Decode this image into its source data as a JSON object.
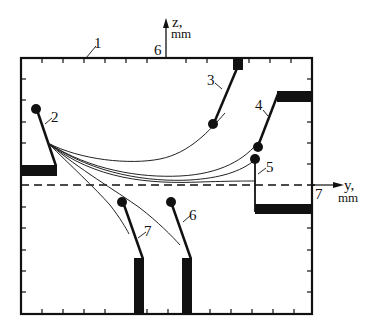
{
  "figure": {
    "type": "schematic",
    "axes": {
      "z_label": "z,",
      "z_unit": "mm",
      "y_label": "y,",
      "y_unit": "mm",
      "z_axis_marker": "6",
      "y_axis_marker": "7"
    },
    "labels": {
      "frame": "1",
      "source": "2",
      "electrode_top": "3",
      "electrode_upper_right": "4",
      "electrode_right": "5",
      "electrode_bottom_right": "6",
      "electrode_bottom_left": "7"
    },
    "colors": {
      "ink": "#111111",
      "background": "#ffffff"
    }
  }
}
